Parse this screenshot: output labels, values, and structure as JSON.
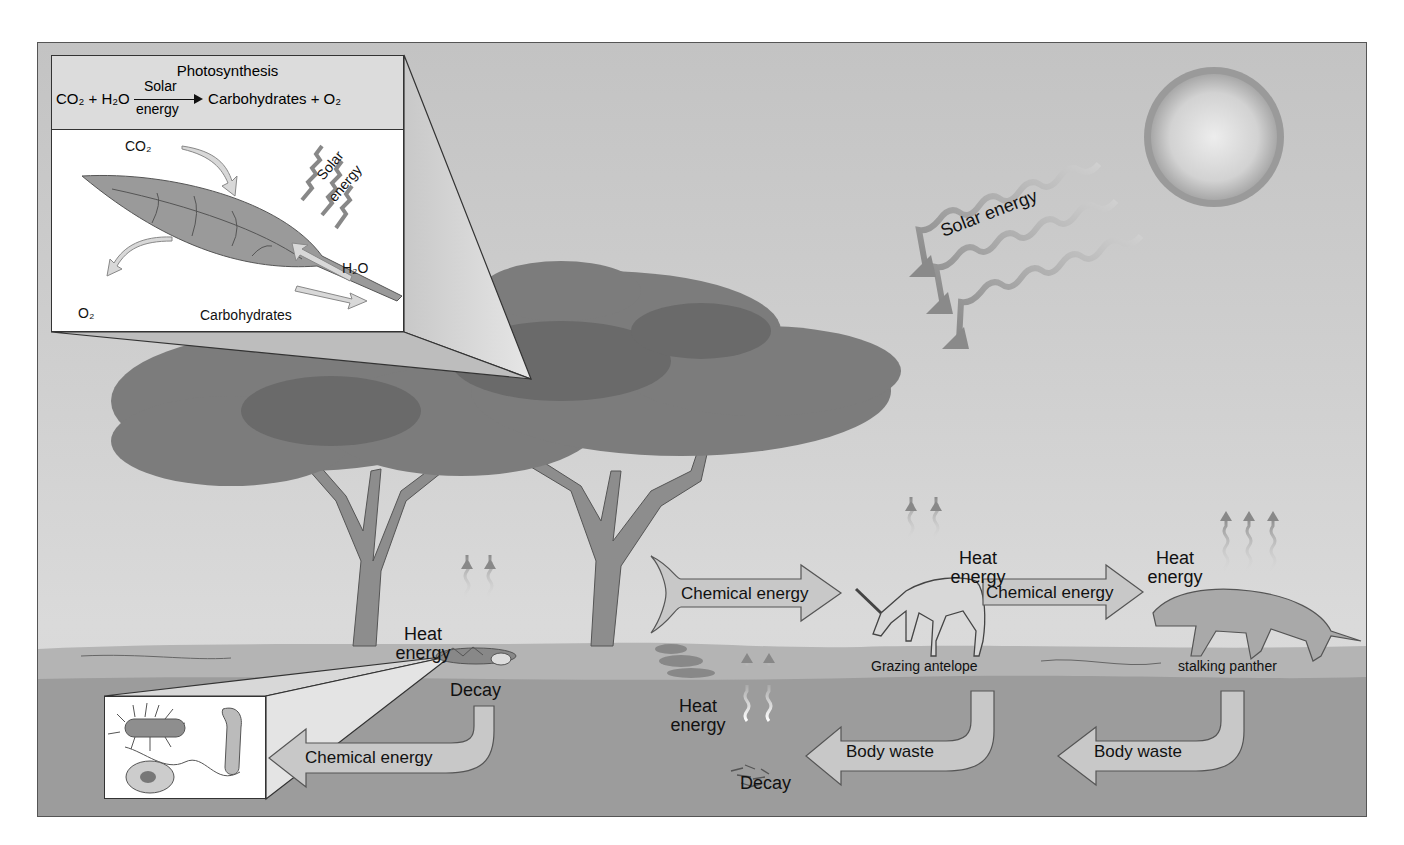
{
  "diagram": {
    "type": "energy-flow-ecosystem",
    "colors": {
      "sky": "#c8c8c8",
      "ground_surface": "#b3b3b3",
      "soil": "#9a9a9a",
      "tree_canopy": "#7e7e7e",
      "arrow_fill": "#c9c9c9",
      "text": "#111111"
    },
    "photosynthesis_inset": {
      "title": "Photosynthesis",
      "equation": {
        "reactants": "CO₂ + H₂O",
        "arrow_top": "Solar",
        "arrow_bottom": "energy",
        "products": "Carbohydrates + O₂"
      },
      "labels": {
        "co2": "CO₂",
        "solar": "Solar",
        "energy": "energy",
        "h2o": "H₂O",
        "o2": "O₂",
        "carbohydrates": "Carbohydrates"
      }
    },
    "sun": {
      "label": "Solar energy"
    },
    "heat_labels": [
      {
        "line1": "Heat",
        "line2": "energy"
      },
      {
        "line1": "Heat",
        "line2": "energy"
      },
      {
        "line1": "Heat",
        "line2": "energy"
      },
      {
        "line1": "Heat",
        "line2": "energy"
      }
    ],
    "flows": {
      "tree_to_antelope": "Chemical energy",
      "antelope_to_panther": "Chemical energy",
      "decay_to_bacteria": "Chemical energy",
      "antelope_waste": "Body waste",
      "panther_waste": "Body waste"
    },
    "organisms": {
      "antelope": "Grazing antelope",
      "panther": "stalking panther"
    },
    "decay_labels": [
      "Decay",
      "Decay"
    ]
  }
}
